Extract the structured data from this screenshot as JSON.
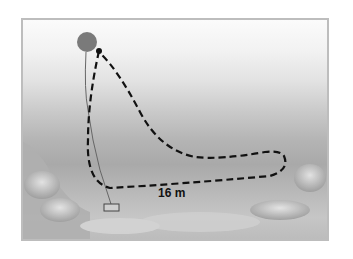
{
  "diagram": {
    "distance_label": "16 m",
    "elements": [
      "surface-marker-buoy",
      "start-point",
      "dashed-swim-path",
      "anchor-weight",
      "buoy-line",
      "seabed-rocks"
    ],
    "colors": {
      "buoy": "#7a7a7a",
      "path": "#111111",
      "water_top": "#fbfbfb",
      "water_deep": "#a9a9a9"
    }
  }
}
